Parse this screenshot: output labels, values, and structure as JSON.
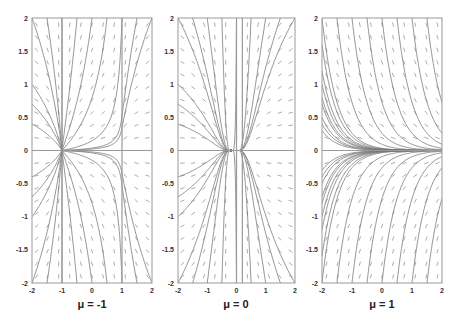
{
  "figure": {
    "panels": [
      {
        "label": "μ = -1",
        "mu": -1
      },
      {
        "label": "μ = 0",
        "mu": 0
      },
      {
        "label": "μ = 1",
        "mu": 1
      }
    ]
  },
  "chart_data": [
    {
      "type": "vector_field",
      "title": "μ = -1",
      "xlabel": "",
      "ylabel": "",
      "xlim": [
        -2,
        2
      ],
      "ylim": [
        -2,
        2
      ],
      "xticks": [
        "-2",
        "-1",
        "0",
        "1",
        "2"
      ],
      "yticks": [
        "-2",
        "-1.5",
        "-1",
        "-0.5",
        "0",
        "0.5",
        "1",
        "1.5",
        "2"
      ],
      "fixed_points": [
        {
          "x": -1,
          "y": 0
        }
      ],
      "singular_lines": [
        {
          "x": -1
        },
        {
          "x": 1
        },
        {
          "y": 0
        }
      ],
      "grid": false
    },
    {
      "type": "vector_field",
      "title": "μ = 0",
      "xlabel": "",
      "ylabel": "",
      "xlim": [
        -2,
        2
      ],
      "ylim": [
        -2,
        2
      ],
      "xticks": [
        "-2",
        "-1",
        "0",
        "1",
        "2"
      ],
      "yticks": [
        "-2",
        "-1.5",
        "-1",
        "-0.5",
        "0",
        "0.5",
        "1",
        "1.5",
        "2"
      ],
      "fixed_points": [
        {
          "x": -0.2,
          "y": 0
        }
      ],
      "singular_lines": [
        {
          "x": 0
        },
        {
          "x": 0.2
        },
        {
          "y": 0
        }
      ],
      "grid": false
    },
    {
      "type": "vector_field",
      "title": "μ = 1",
      "xlabel": "",
      "ylabel": "",
      "xlim": [
        -2,
        2
      ],
      "ylim": [
        -2,
        2
      ],
      "xticks": [
        "-2",
        "-1",
        "0",
        "1",
        "2"
      ],
      "yticks": [
        "-2",
        "-1.5",
        "-1",
        "-0.5",
        "0",
        "0.5",
        "1",
        "1.5",
        "2"
      ],
      "fixed_points": [],
      "singular_lines": [
        {
          "y": 0
        }
      ],
      "grid": false
    }
  ],
  "layout": {
    "panels_px": [
      {
        "x0": 32,
        "x1": 152,
        "y0": 18,
        "y1": 283,
        "label_x": 92
      },
      {
        "x0": 178,
        "x1": 295,
        "y0": 18,
        "y1": 283,
        "label_x": 236
      },
      {
        "x0": 322,
        "x1": 442,
        "y0": 18,
        "y1": 283,
        "label_x": 382
      }
    ],
    "line_color": "#777777",
    "arrow_color": "#888888",
    "axis_color": "#999999"
  }
}
